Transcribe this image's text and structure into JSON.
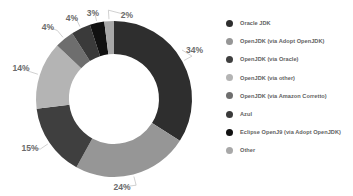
{
  "chart_data": {
    "type": "pie",
    "title": "",
    "xlabel": "",
    "ylabel": "",
    "donut": true,
    "legend_position": "right",
    "grid": false,
    "categories": [
      "Oracle JDK",
      "OpenJDK (via Adopt OpenJDK)",
      "OpenJDK (via Oracle)",
      "OpenJDK (via other)",
      "OpenJDK (via Amazon Corretto)",
      "Azul",
      "Eclipse OpenJ9 (via Adopt OpenJDK)",
      "Other"
    ],
    "values": [
      34,
      24,
      15,
      14,
      4,
      4,
      3,
      2
    ],
    "value_labels": [
      "34%",
      "24%",
      "15%",
      "14%",
      "4%",
      "4%",
      "3%",
      "2%"
    ],
    "colors": [
      "#2e2e2e",
      "#969696",
      "#3f3f3f",
      "#b4b4b4",
      "#6e6e6e",
      "#3a3a3a",
      "#111111",
      "#a8a8a8"
    ]
  },
  "legend": {
    "items": [
      {
        "label": "Oracle JDK",
        "color": "#2e2e2e"
      },
      {
        "label": "OpenJDK (via Adopt OpenJDK)",
        "color": "#969696"
      },
      {
        "label": "OpenJDK (via Oracle)",
        "color": "#3f3f3f"
      },
      {
        "label": "OpenJDK (via other)",
        "color": "#b4b4b4"
      },
      {
        "label": "OpenJDK (via Amazon Corretto)",
        "color": "#6e6e6e"
      },
      {
        "label": "Azul",
        "color": "#3a3a3a"
      },
      {
        "label": "Eclipse OpenJ9 (via Adopt OpenJDK)",
        "color": "#111111"
      },
      {
        "label": "Other",
        "color": "#a8a8a8"
      }
    ]
  },
  "labels": {
    "s0": "34%",
    "s1": "24%",
    "s2": "15%",
    "s3": "14%",
    "s4": "4%",
    "s5": "4%",
    "s6": "3%",
    "s7": "2%"
  }
}
